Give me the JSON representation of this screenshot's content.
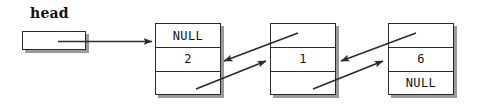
{
  "diagram": {
    "head_label": "head",
    "head_box_value": "",
    "nodes": [
      {
        "prev": "NULL",
        "data": "2",
        "next": ""
      },
      {
        "prev": "",
        "data": "1",
        "next": ""
      },
      {
        "prev": "",
        "data": "6",
        "next": "NULL"
      }
    ],
    "connectors": [
      {
        "name": "head-to-node-0",
        "style": "straight-arrow",
        "direction": "right"
      },
      {
        "name": "node-0-next-to-node-1",
        "style": "diagonal-arrow",
        "direction": "right"
      },
      {
        "name": "node-1-prev-to-node-0",
        "style": "diagonal-arrow",
        "direction": "left"
      },
      {
        "name": "node-1-next-to-node-2",
        "style": "diagonal-arrow",
        "direction": "right"
      },
      {
        "name": "node-2-prev-to-node-1",
        "style": "diagonal-arrow",
        "direction": "left"
      }
    ],
    "colors": {
      "stroke": "#2b2b2b",
      "shadow": "#9a9a9a",
      "fill": "#ffffff",
      "text": "#111111"
    }
  }
}
